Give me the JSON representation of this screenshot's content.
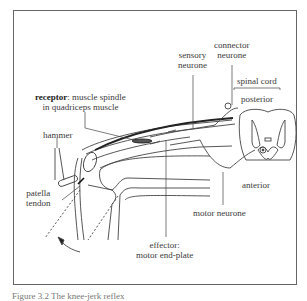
{
  "diagram": {
    "labels": {
      "receptor_bold": "receptor",
      "receptor_rest": ": muscle spindle",
      "receptor_line2": "in quadriceps muscle",
      "hammer": "hammer",
      "patella_line1": "patella",
      "patella_line2": "tendon",
      "sensory_line1": "sensory",
      "sensory_line2": "neurone",
      "connector_line1": "connector",
      "connector_line2": "neurone",
      "spinal_cord": "spinal cord",
      "posterior": "posterior",
      "anterior": "anterior",
      "motor_neurone": "motor neurone",
      "effector_line1": "effector:",
      "effector_line2": "motor end-plate"
    },
    "caption": "Figure 3.2  The knee-jerk reflex"
  }
}
